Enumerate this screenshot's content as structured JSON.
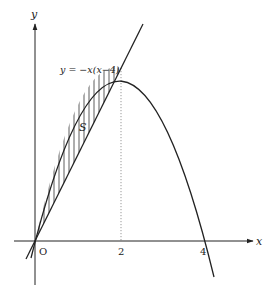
{
  "diagram": {
    "type": "function-graph",
    "axes": {
      "x_label": "x",
      "y_label": "y",
      "origin_label": "O",
      "x_ticks": [
        "2",
        "4"
      ]
    },
    "curves": [
      {
        "name": "parabola",
        "equation_label": "y = −x(x−4)"
      },
      {
        "name": "line",
        "equation_label": ""
      }
    ],
    "region": {
      "label": "S",
      "hatch": "vertical"
    },
    "guide": {
      "x": 2,
      "style": "dotted"
    },
    "colors": {
      "stroke": "#222222",
      "guide": "#999999",
      "background": "#ffffff"
    }
  }
}
